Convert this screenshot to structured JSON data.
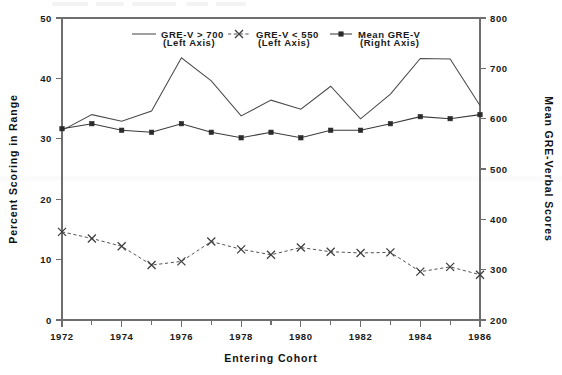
{
  "chart_data": {
    "type": "line",
    "title": "",
    "subtitle": "",
    "xlabel": "Entering Cohort",
    "ylabel": "Percent Scoring in Range",
    "y2label": "Mean GRE-Verbal Scores",
    "grid": false,
    "legend_position": "top-center",
    "x": [
      1972,
      1973,
      1974,
      1975,
      1976,
      1977,
      1978,
      1979,
      1980,
      1981,
      1982,
      1983,
      1984,
      1985,
      1986
    ],
    "xlim": [
      1972,
      1986
    ],
    "xticks_major": [
      1972,
      1974,
      1976,
      1978,
      1980,
      1982,
      1984,
      1986
    ],
    "xticks_minor": [
      1973,
      1975,
      1977,
      1979,
      1981,
      1983,
      1985
    ],
    "xtick_labels": [
      "1972",
      "1974",
      "1976",
      "1978",
      "1980",
      "1982",
      "1984",
      "1986"
    ],
    "ylim": [
      0,
      50
    ],
    "yticks": [
      0,
      10,
      20,
      30,
      40,
      50
    ],
    "ytick_labels": [
      "0",
      "10",
      "20",
      "30",
      "40",
      "50"
    ],
    "y2lim": [
      200,
      800
    ],
    "y2ticks": [
      200,
      300,
      400,
      500,
      600,
      700,
      800
    ],
    "y2tick_labels": [
      "200",
      "300",
      "400",
      "500",
      "600",
      "700",
      "800"
    ],
    "series": [
      {
        "name": "GRE-V > 700",
        "axis": "left",
        "axis_note": "(Left Axis)",
        "style": "solid",
        "marker": "none",
        "color": "#4a4a4a",
        "values": [
          31.4,
          34.0,
          32.9,
          34.6,
          43.4,
          39.6,
          33.8,
          36.4,
          34.9,
          38.7,
          33.3,
          37.4,
          43.3,
          43.2,
          35.5
        ]
      },
      {
        "name": "GRE-V < 550",
        "axis": "left",
        "axis_note": "(Left Axis)",
        "style": "dashed",
        "marker": "x",
        "color": "#3d3d3d",
        "values": [
          14.6,
          13.5,
          12.2,
          9.1,
          9.7,
          13.0,
          11.7,
          10.8,
          12.0,
          11.3,
          11.1,
          11.2,
          8.0,
          8.8,
          7.5
        ]
      },
      {
        "name": "Mean GRE-V",
        "axis": "right",
        "axis_note": "(Right Axis)",
        "style": "solid",
        "marker": "square",
        "color": "#2b2b2b",
        "values": [
          580,
          590,
          577,
          573,
          590,
          573,
          562,
          573,
          562,
          577,
          577,
          590,
          604,
          600,
          608
        ]
      }
    ]
  },
  "legend": {
    "entries": [
      {
        "label": "GRE-V > 700",
        "sub": "(Left Axis)",
        "marker": "line"
      },
      {
        "label": "GRE-V < 550",
        "sub": "(Left Axis)",
        "marker": "dashed-x"
      },
      {
        "label": "Mean GRE-V",
        "sub": "(Right Axis)",
        "marker": "line-square"
      }
    ]
  }
}
